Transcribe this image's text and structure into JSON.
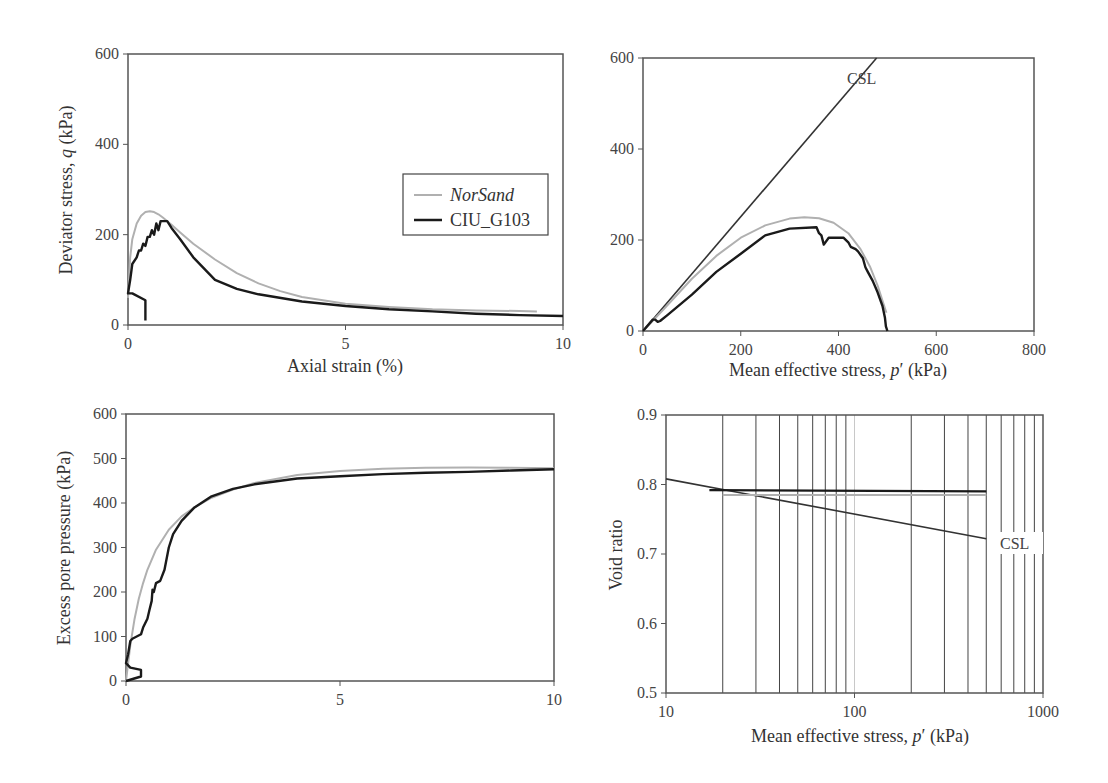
{
  "colors": {
    "model": "#b0b0b0",
    "test": "#1a1a1a",
    "csl": "#333333",
    "axis": "#555555",
    "grid": "#444444"
  },
  "legend": {
    "items": [
      {
        "label": "NorSand",
        "italic": true,
        "color": "#b0b0b0"
      },
      {
        "label": "CIU_G103",
        "italic": false,
        "color": "#1a1a1a"
      }
    ]
  },
  "chart_data": [
    {
      "id": "q-vs-strain",
      "type": "line",
      "title": "",
      "xlabel": "Axial strain (%)",
      "ylabel": "Deviator stress, q (kPa)",
      "xlim": [
        0,
        10
      ],
      "ylim": [
        0,
        600
      ],
      "xticks": [
        0,
        5,
        10
      ],
      "yticks": [
        0,
        200,
        400,
        600
      ],
      "grid": false,
      "legend_position": "upper right (inside)",
      "series": [
        {
          "name": "NorSand",
          "x": [
            0,
            0.05,
            0.1,
            0.2,
            0.3,
            0.4,
            0.5,
            0.6,
            0.7,
            0.8,
            1.0,
            1.2,
            1.5,
            2.0,
            2.5,
            3.0,
            3.5,
            4.0,
            5.0,
            6.0,
            7.0,
            8.0,
            9.0,
            9.4
          ],
          "y": [
            60,
            150,
            190,
            225,
            242,
            250,
            252,
            250,
            245,
            238,
            222,
            205,
            180,
            145,
            115,
            92,
            75,
            62,
            47,
            40,
            35,
            32,
            31,
            30
          ]
        },
        {
          "name": "CIU_G103",
          "x": [
            0.4,
            0.4,
            0.1,
            0,
            0.05,
            0.1,
            0.2,
            0.25,
            0.3,
            0.35,
            0.4,
            0.45,
            0.5,
            0.55,
            0.6,
            0.65,
            0.7,
            0.75,
            0.8,
            0.9,
            1.0,
            1.2,
            1.5,
            2.0,
            2.5,
            3.0,
            4.0,
            5.0,
            6.0,
            7.0,
            8.0,
            9.0,
            10.0
          ],
          "y": [
            10,
            55,
            70,
            70,
            100,
            135,
            150,
            165,
            165,
            180,
            175,
            195,
            195,
            210,
            200,
            225,
            210,
            230,
            230,
            230,
            215,
            190,
            150,
            100,
            80,
            68,
            52,
            42,
            35,
            30,
            25,
            22,
            20
          ]
        }
      ]
    },
    {
      "id": "stress-path",
      "type": "line",
      "title": "",
      "xlabel": "Mean effective stress, p′ (kPa)",
      "ylabel": "",
      "xlim": [
        0,
        800
      ],
      "ylim": [
        0,
        600
      ],
      "xticks": [
        0,
        200,
        400,
        600,
        800
      ],
      "yticks": [
        0,
        200,
        400,
        600
      ],
      "grid": false,
      "annotations": [
        {
          "text": "CSL",
          "x": 345,
          "y": 545
        }
      ],
      "series": [
        {
          "name": "CSL",
          "x": [
            0,
            478
          ],
          "y": [
            0,
            600
          ]
        },
        {
          "name": "NorSand",
          "x": [
            0,
            40,
            100,
            150,
            200,
            250,
            300,
            330,
            360,
            390,
            420,
            445,
            465,
            480,
            492,
            498
          ],
          "y": [
            0,
            45,
            115,
            165,
            205,
            232,
            247,
            250,
            248,
            238,
            215,
            180,
            140,
            100,
            60,
            40
          ]
        },
        {
          "name": "CIU_G103",
          "x": [
            0,
            20,
            25,
            30,
            35,
            50,
            100,
            150,
            200,
            250,
            300,
            355,
            360,
            365,
            370,
            380,
            410,
            420,
            425,
            435,
            440,
            450,
            455,
            460,
            470,
            480,
            490,
            495,
            497,
            500
          ],
          "y": [
            0,
            25,
            25,
            20,
            22,
            35,
            80,
            130,
            170,
            210,
            225,
            228,
            215,
            210,
            190,
            205,
            205,
            195,
            185,
            180,
            175,
            160,
            140,
            130,
            110,
            85,
            55,
            30,
            10,
            0
          ]
        }
      ]
    },
    {
      "id": "pore-pressure-vs-strain",
      "type": "line",
      "title": "",
      "xlabel": "",
      "ylabel": "Excess pore pressure (kPa)",
      "xlim": [
        0,
        10
      ],
      "ylim": [
        0,
        600
      ],
      "xticks": [
        0,
        5,
        10
      ],
      "yticks": [
        0,
        100,
        200,
        300,
        400,
        500,
        600
      ],
      "grid": false,
      "series": [
        {
          "name": "NorSand",
          "x": [
            0,
            0.1,
            0.2,
            0.3,
            0.4,
            0.5,
            0.7,
            1.0,
            1.3,
            1.6,
            2.0,
            2.5,
            3.0,
            4.0,
            5.0,
            6.0,
            7.0,
            8.0,
            9.0,
            10.0
          ],
          "y": [
            0,
            80,
            140,
            185,
            220,
            250,
            295,
            340,
            370,
            390,
            412,
            430,
            445,
            463,
            472,
            477,
            479,
            480,
            479,
            478
          ]
        },
        {
          "name": "CIU_G103",
          "x": [
            0,
            0.35,
            0.35,
            0.1,
            0,
            0.05,
            0.1,
            0.15,
            0.35,
            0.4,
            0.5,
            0.55,
            0.6,
            0.62,
            0.65,
            0.7,
            0.8,
            0.9,
            1.0,
            1.1,
            1.3,
            1.6,
            2.0,
            2.5,
            3.0,
            4.0,
            5.0,
            6.0,
            7.0,
            8.0,
            9.0,
            10.0
          ],
          "y": [
            0,
            10,
            25,
            30,
            40,
            60,
            90,
            95,
            105,
            120,
            140,
            160,
            180,
            205,
            200,
            220,
            225,
            250,
            300,
            330,
            360,
            390,
            415,
            432,
            442,
            455,
            460,
            465,
            468,
            470,
            473,
            476
          ]
        }
      ]
    },
    {
      "id": "void-ratio-vs-p",
      "type": "line",
      "title": "",
      "xlabel": "Mean effective stress, p′ (kPa)",
      "ylabel": "Void ratio",
      "xscale": "log",
      "xlim": [
        10,
        1000
      ],
      "ylim": [
        0.5,
        0.9
      ],
      "xticks": [
        10,
        100,
        1000
      ],
      "yticks": [
        0.5,
        0.6,
        0.7,
        0.8,
        0.9
      ],
      "grid": true,
      "grid_lines_x": [
        20,
        30,
        40,
        50,
        60,
        70,
        80,
        90,
        100,
        200,
        300,
        400,
        500,
        600,
        700,
        800,
        900
      ],
      "annotations": [
        {
          "text": "CSL",
          "x": 600,
          "y": 0.72
        }
      ],
      "series": [
        {
          "name": "CSL",
          "x": [
            10,
            500
          ],
          "y": [
            0.808,
            0.722
          ]
        },
        {
          "name": "NorSand",
          "x": [
            20,
            500
          ],
          "y": [
            0.785,
            0.785
          ]
        },
        {
          "name": "CIU_G103",
          "x": [
            17,
            500
          ],
          "y": [
            0.792,
            0.79
          ]
        }
      ]
    }
  ]
}
